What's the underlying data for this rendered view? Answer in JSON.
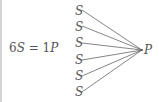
{
  "equation": {
    "lhs_coeff": "6",
    "lhs_var": "S",
    "equals": " = ",
    "rhs_coeff": "1",
    "rhs_var": "P"
  },
  "diagram": {
    "sources": [
      "S",
      "S",
      "S",
      "S",
      "S",
      "S"
    ],
    "target": "P",
    "line_color": "#666666"
  }
}
